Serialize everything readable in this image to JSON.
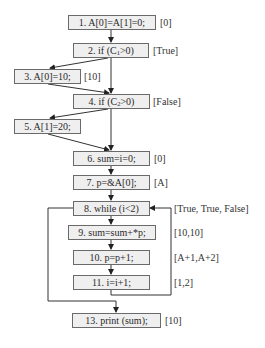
{
  "nodes": [
    {
      "id": "1",
      "label_pre": "1. A[0]=A[1]=0;",
      "sub": "",
      "label_post": "",
      "annotation": "[0]"
    },
    {
      "id": "2",
      "label_pre": "2. if (C",
      "sub": "1",
      "label_post": ">0)",
      "annotation": "[True]"
    },
    {
      "id": "3",
      "label_pre": "3. A[0]=10;",
      "sub": "",
      "label_post": "",
      "annotation": "[10]"
    },
    {
      "id": "4",
      "label_pre": "4. if (C",
      "sub": "2",
      "label_post": ">0)",
      "annotation": "[False]"
    },
    {
      "id": "5",
      "label_pre": "5. A[1]=20;",
      "sub": "",
      "label_post": "",
      "annotation": ""
    },
    {
      "id": "6",
      "label_pre": "6. sum=i=0;",
      "sub": "",
      "label_post": "",
      "annotation": "[0]"
    },
    {
      "id": "7",
      "label_pre": "7. p=&A[0];",
      "sub": "",
      "label_post": "",
      "annotation": "[A]"
    },
    {
      "id": "8",
      "label_pre": "8. while (i<2)",
      "sub": "",
      "label_post": "",
      "annotation": "[True, True, False]"
    },
    {
      "id": "9",
      "label_pre": "9. sum=sum+*p;",
      "sub": "",
      "label_post": "",
      "annotation": "[10,10]"
    },
    {
      "id": "10",
      "label_pre": "10. p=p+1;",
      "sub": "",
      "label_post": "",
      "annotation": "[A+1,A+2]"
    },
    {
      "id": "11",
      "label_pre": "11. i=i+1;",
      "sub": "",
      "label_post": "",
      "annotation": "[1,2]"
    },
    {
      "id": "13",
      "label_pre": "13. print (sum);",
      "sub": "",
      "label_post": "",
      "annotation": "[10]"
    }
  ],
  "edges": [
    {
      "from": "1",
      "to": "2"
    },
    {
      "from": "2",
      "to": "3"
    },
    {
      "from": "2",
      "to": "4"
    },
    {
      "from": "3",
      "to": "4"
    },
    {
      "from": "4",
      "to": "5"
    },
    {
      "from": "4",
      "to": "6"
    },
    {
      "from": "5",
      "to": "6"
    },
    {
      "from": "6",
      "to": "7"
    },
    {
      "from": "7",
      "to": "8"
    },
    {
      "from": "8",
      "to": "9"
    },
    {
      "from": "9",
      "to": "10"
    },
    {
      "from": "10",
      "to": "11"
    },
    {
      "from": "11",
      "to": "8",
      "kind": "loop-back"
    },
    {
      "from": "8",
      "to": "13",
      "kind": "loop-exit"
    }
  ]
}
